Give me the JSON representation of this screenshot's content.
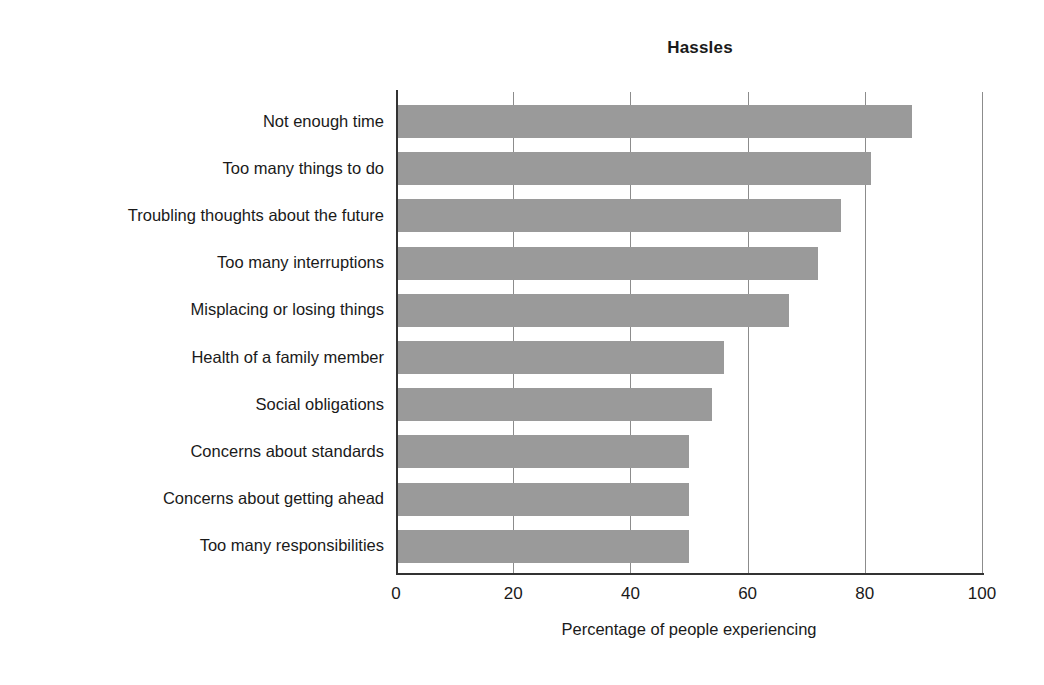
{
  "chart_data": {
    "type": "bar",
    "orientation": "horizontal",
    "title": "Hassles",
    "xlabel": "Percentage of people experiencing",
    "ylabel": "",
    "xlim": [
      0,
      100
    ],
    "xticks": [
      "0",
      "20",
      "40",
      "60",
      "80",
      "100"
    ],
    "xtick_values": [
      0,
      20,
      40,
      60,
      80,
      100
    ],
    "grid": "vertical gridlines at each x tick",
    "legend": "none",
    "bar_color": "#9a9a9a",
    "categories": [
      "Not enough time",
      "Too many things to do",
      "Troubling thoughts about the future",
      "Too many interruptions",
      "Misplacing or losing things",
      "Health of a family member",
      "Social obligations",
      "Concerns about standards",
      "Concerns about getting ahead",
      "Too many responsibilities"
    ],
    "values": [
      88,
      81,
      76,
      72,
      67,
      56,
      54,
      50,
      50,
      50
    ]
  }
}
